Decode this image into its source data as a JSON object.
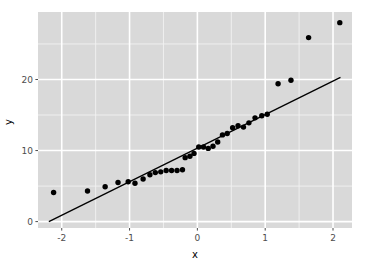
{
  "figure": {
    "background": "#ffffff",
    "panel_background": "#d9d9d9",
    "grid_major_color": "#ffffff",
    "grid_minor_color": "#f2f2f2",
    "point_color": "#000000",
    "line_color": "#000000",
    "tick_color": "#4d4d4d"
  },
  "chart_data": {
    "type": "scatter",
    "title": "",
    "subtitle": "",
    "xlabel": "x",
    "ylabel": "y",
    "xlim": [
      -2.35,
      2.28
    ],
    "ylim": [
      -0.9,
      29.5
    ],
    "xticks": [
      -2,
      -1,
      0,
      1,
      2
    ],
    "xtick_labels": [
      "-2",
      "-1",
      "0",
      "1",
      "2"
    ],
    "yticks": [
      0,
      10,
      20
    ],
    "ytick_labels": [
      "0",
      "10",
      "20"
    ],
    "grid": true,
    "legend": null,
    "points": [
      {
        "x": -2.12,
        "y": 4.1
      },
      {
        "x": -1.62,
        "y": 4.3
      },
      {
        "x": -1.36,
        "y": 4.9
      },
      {
        "x": -1.17,
        "y": 5.5
      },
      {
        "x": -1.02,
        "y": 5.6
      },
      {
        "x": -0.92,
        "y": 5.4
      },
      {
        "x": -0.8,
        "y": 6.0
      },
      {
        "x": -0.7,
        "y": 6.6
      },
      {
        "x": -0.62,
        "y": 6.9
      },
      {
        "x": -0.54,
        "y": 7.0
      },
      {
        "x": -0.46,
        "y": 7.2
      },
      {
        "x": -0.38,
        "y": 7.2
      },
      {
        "x": -0.3,
        "y": 7.2
      },
      {
        "x": -0.22,
        "y": 7.3
      },
      {
        "x": -0.18,
        "y": 9.0
      },
      {
        "x": -0.11,
        "y": 9.2
      },
      {
        "x": -0.05,
        "y": 9.6
      },
      {
        "x": 0.02,
        "y": 10.5
      },
      {
        "x": 0.09,
        "y": 10.5
      },
      {
        "x": 0.16,
        "y": 10.3
      },
      {
        "x": 0.23,
        "y": 10.6
      },
      {
        "x": 0.3,
        "y": 11.2
      },
      {
        "x": 0.37,
        "y": 12.2
      },
      {
        "x": 0.44,
        "y": 12.4
      },
      {
        "x": 0.52,
        "y": 13.2
      },
      {
        "x": 0.6,
        "y": 13.5
      },
      {
        "x": 0.68,
        "y": 13.3
      },
      {
        "x": 0.76,
        "y": 13.9
      },
      {
        "x": 0.85,
        "y": 14.6
      },
      {
        "x": 0.95,
        "y": 14.9
      },
      {
        "x": 1.03,
        "y": 15.1
      },
      {
        "x": 1.19,
        "y": 19.4
      },
      {
        "x": 1.38,
        "y": 19.9
      },
      {
        "x": 1.64,
        "y": 25.9
      },
      {
        "x": 2.1,
        "y": 28.0
      }
    ],
    "fit_line": {
      "type": "line",
      "slope": 4.73,
      "intercept": 10.35,
      "x_start": -2.19,
      "y_start": 0.0,
      "x_end": 2.11,
      "y_end": 20.3
    }
  },
  "axes": {
    "x_title": "x",
    "y_title": "y"
  }
}
